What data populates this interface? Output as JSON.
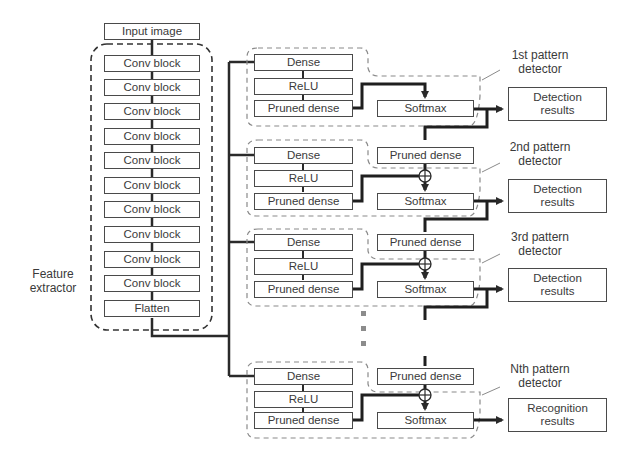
{
  "feature_extractor": {
    "input_label": "Input image",
    "label": "Feature\nextractor",
    "label_line1": "Feature",
    "label_line2": "extractor",
    "blocks": [
      "Conv block",
      "Conv block",
      "Conv block",
      "Conv block",
      "Conv block",
      "Conv block",
      "Conv block",
      "Conv block",
      "Conv block",
      "Conv block"
    ],
    "flatten_label": "Flatten"
  },
  "detectors": [
    {
      "name_line1": "1st pattern",
      "name_line2": "detector",
      "dense": "Dense",
      "relu": "ReLU",
      "pruned_dense": "Pruned dense",
      "softmax": "Softmax",
      "result_line1": "Detection",
      "result_line2": "results"
    },
    {
      "name_line1": "2nd pattern",
      "name_line2": "detector",
      "dense": "Dense",
      "relu": "ReLU",
      "pruned_dense": "Pruned dense",
      "side_pruned_dense": "Pruned dense",
      "softmax": "Softmax",
      "result_line1": "Detection",
      "result_line2": "results"
    },
    {
      "name_line1": "3rd pattern",
      "name_line2": "detector",
      "dense": "Dense",
      "relu": "ReLU",
      "pruned_dense": "Pruned dense",
      "side_pruned_dense": "Pruned dense",
      "softmax": "Softmax",
      "result_line1": "Detection",
      "result_line2": "results"
    },
    {
      "name_line1": "Nth pattern",
      "name_line2": "detector",
      "dense": "Dense",
      "relu": "ReLU",
      "pruned_dense": "Pruned dense",
      "side_pruned_dense": "Pruned dense",
      "softmax": "Softmax",
      "result_line1": "Recognition",
      "result_line2": "results"
    }
  ],
  "colors": {
    "line": "#2a2a2a",
    "box_border": "#4a4a4a",
    "dashed": "#8a8a8a",
    "text": "#3a3a3a"
  }
}
